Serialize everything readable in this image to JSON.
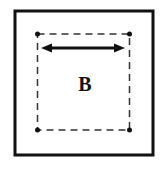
{
  "diagram": {
    "label": "B",
    "colors": {
      "outer_border": "#111111",
      "dashed_border": "#333333",
      "corner_dot": "#111111",
      "arrow": "#111111",
      "background": "#ffffff"
    },
    "elements": {
      "outer_square": "solid",
      "inner_square": "dashed",
      "corner_points": 4,
      "arrow": "double-headed horizontal"
    }
  }
}
